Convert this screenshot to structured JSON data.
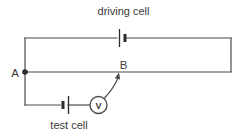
{
  "diagram": {
    "type": "circuit-potentiometer",
    "labels": {
      "driving_cell": "driving cell",
      "test_cell": "test cell",
      "point_a": "A",
      "point_b": "B",
      "voltmeter": "V"
    },
    "components": [
      "driving cell (top branch battery)",
      "potentiometer wire A-B",
      "test cell (bottom branch battery)",
      "voltmeter",
      "sliding contact arrow to B"
    ],
    "colors": {
      "wire": "#4a4a4a",
      "plate": "#2b2b2b",
      "text": "#3a3a3a",
      "background": "#ffffff"
    }
  }
}
